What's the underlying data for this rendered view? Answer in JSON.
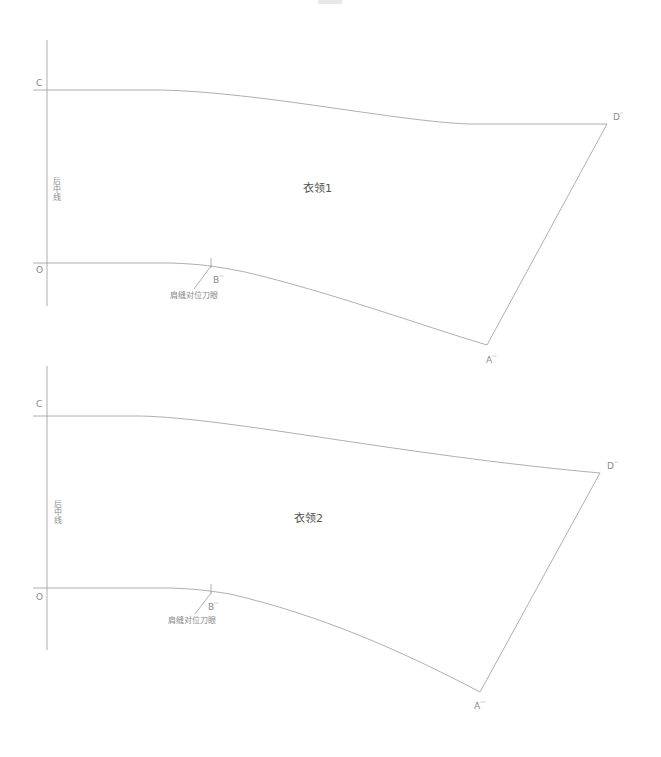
{
  "diagram": {
    "type": "garment-pattern",
    "stroke_color": "#9a9a9a",
    "pieces": [
      {
        "title": "衣领1",
        "center_back_label": "后中线",
        "points": {
          "C": {
            "name": "C",
            "sup": ""
          },
          "O": {
            "name": "O",
            "sup": ""
          },
          "D": {
            "name": "D",
            "sup": "''"
          },
          "B": {
            "name": "B",
            "sup": "'''"
          },
          "A": {
            "name": "A",
            "sup": "'''"
          }
        },
        "notch_label": "肩缝对位刀眼"
      },
      {
        "title": "衣领2",
        "center_back_label": "后中线",
        "points": {
          "C": {
            "name": "C",
            "sup": ""
          },
          "O": {
            "name": "O",
            "sup": ""
          },
          "D": {
            "name": "D",
            "sup": "'''"
          },
          "B": {
            "name": "B",
            "sup": "'''"
          },
          "A": {
            "name": "A",
            "sup": "''''"
          }
        },
        "notch_label": "肩缝对位刀眼"
      }
    ]
  }
}
